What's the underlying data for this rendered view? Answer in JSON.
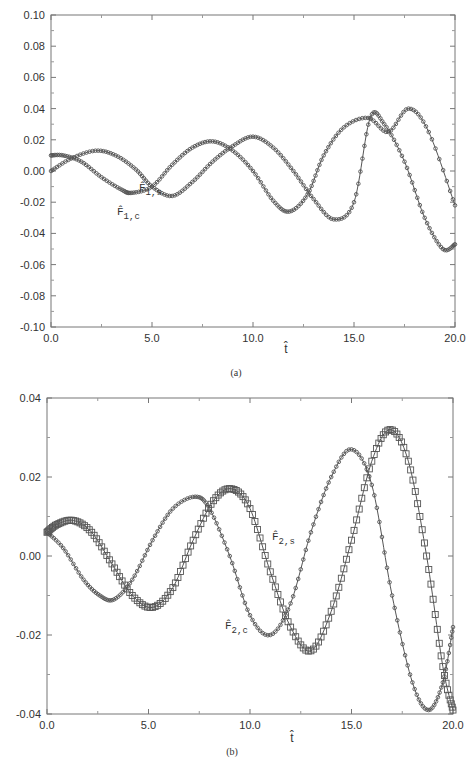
{
  "chart_data": [
    {
      "panel": "(a)",
      "type": "line",
      "title": "",
      "xlabel": "t̂",
      "ylabel": "",
      "xlim": [
        0.0,
        20.0
      ],
      "ylim": [
        -0.1,
        0.1
      ],
      "xticks": [
        "0.0",
        "5.0",
        "10.0",
        "15.0",
        "20.0"
      ],
      "yticks": [
        "0.10",
        "0.08",
        "0.06",
        "0.04",
        "0.02",
        "0.00",
        "-0.02",
        "-0.04",
        "-0.06",
        "-0.08",
        "-0.10"
      ],
      "grid": false,
      "series": [
        {
          "name": "F̂1,s",
          "label_sub": "1,s",
          "marker": "small circle",
          "x": [
            0.0,
            1.0,
            2.2,
            3.2,
            4.2,
            5.0,
            6.0,
            7.0,
            8.0,
            9.0,
            10.0,
            11.0,
            12.0,
            13.0,
            14.0,
            15.0,
            15.8,
            16.5,
            17.5,
            18.5,
            19.4,
            20.0
          ],
          "y": [
            0.0,
            0.008,
            0.013,
            0.01,
            0.001,
            -0.01,
            -0.016,
            -0.007,
            0.006,
            0.016,
            0.022,
            0.015,
            0.0,
            -0.018,
            -0.031,
            -0.02,
            0.034,
            0.03,
            0.006,
            -0.03,
            -0.05,
            -0.047
          ]
        },
        {
          "name": "F̂1,c",
          "label_sub": "1,c",
          "marker": "small circle",
          "x": [
            0.0,
            0.6,
            1.5,
            2.5,
            3.5,
            4.0,
            5.0,
            6.0,
            7.0,
            8.0,
            9.0,
            10.0,
            11.0,
            11.8,
            12.7,
            13.5,
            14.5,
            15.7,
            16.7,
            17.7,
            18.7,
            20.0
          ],
          "y": [
            0.01,
            0.01,
            0.006,
            -0.004,
            -0.012,
            -0.014,
            -0.01,
            0.004,
            0.015,
            0.019,
            0.013,
            0.0,
            -0.019,
            -0.026,
            -0.015,
            0.01,
            0.028,
            0.034,
            0.025,
            0.04,
            0.025,
            -0.022
          ]
        }
      ],
      "annotations": [
        "F̂1,s",
        "F̂1,c"
      ]
    },
    {
      "panel": "(b)",
      "type": "line",
      "title": "",
      "xlabel": "t̂",
      "ylabel": "",
      "xlim": [
        0.0,
        20.0
      ],
      "ylim": [
        -0.04,
        0.04
      ],
      "xticks": [
        "0.0",
        "5.0",
        "10.0",
        "15.0",
        "20.0"
      ],
      "yticks": [
        "0.04",
        "0.02",
        "0.00",
        "-0.02",
        "-0.04"
      ],
      "grid": false,
      "series": [
        {
          "name": "F̂2,s",
          "label_sub": "2,s",
          "marker": "square",
          "x": [
            0.0,
            0.5,
            1.3,
            2.2,
            3.2,
            4.2,
            5.2,
            6.2,
            7.2,
            8.2,
            9.1,
            10.0,
            11.0,
            12.0,
            13.0,
            14.0,
            15.0,
            16.0,
            16.9,
            17.8,
            18.7,
            19.5,
            20.0
          ],
          "y": [
            0.006,
            0.008,
            0.009,
            0.006,
            -0.002,
            -0.01,
            -0.013,
            -0.008,
            0.004,
            0.014,
            0.017,
            0.012,
            -0.004,
            -0.018,
            -0.024,
            -0.014,
            0.004,
            0.024,
            0.032,
            0.024,
            0.0,
            -0.028,
            -0.039
          ]
        },
        {
          "name": "F̂2,c",
          "label_sub": "2,c",
          "marker": "small circle",
          "x": [
            0.0,
            0.8,
            1.8,
            2.6,
            3.3,
            4.2,
            5.2,
            6.2,
            7.3,
            8.0,
            9.0,
            10.0,
            11.0,
            12.0,
            13.0,
            14.0,
            15.0,
            16.0,
            17.0,
            18.0,
            18.8,
            19.5,
            20.0
          ],
          "y": [
            0.006,
            0.002,
            -0.006,
            -0.01,
            -0.011,
            -0.006,
            0.004,
            0.012,
            0.015,
            0.012,
            0.0,
            -0.015,
            -0.02,
            -0.012,
            0.006,
            0.02,
            0.027,
            0.018,
            -0.01,
            -0.032,
            -0.039,
            -0.032,
            -0.018
          ]
        }
      ],
      "annotations": [
        "F̂2,s",
        "F̂2,c"
      ]
    }
  ],
  "captions": {
    "a": "(a)",
    "b": "(b)"
  },
  "axis_label": {
    "t_hat": "t̂"
  },
  "labels": {
    "a_s": {
      "base": "F̂",
      "sub": "1,s"
    },
    "a_c": {
      "base": "F̂",
      "sub": "1,c"
    },
    "b_s": {
      "base": "F̂",
      "sub": "2,s"
    },
    "b_c": {
      "base": "F̂",
      "sub": "2,c"
    }
  },
  "colors": {
    "line": "#555555",
    "axis": "#666666",
    "text": "#333333"
  }
}
